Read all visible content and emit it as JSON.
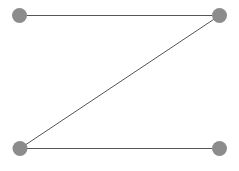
{
  "figure": {
    "width": 239,
    "height": 171,
    "background_color": "#ffffff"
  },
  "style": {
    "node_color": "#8c8c8c",
    "edge_color": "#555555",
    "node_radius": 7.5,
    "edge_width": 1
  },
  "chart_data": {
    "type": "diagram",
    "subtype": "node-link-graph",
    "title": "",
    "nodes": [
      {
        "id": "n1",
        "label": "",
        "x": 19.5,
        "y": 15.5,
        "position": "top-left",
        "degree": 1
      },
      {
        "id": "n2",
        "label": "",
        "x": 219.5,
        "y": 15.5,
        "position": "top-right",
        "degree": 2
      },
      {
        "id": "n3",
        "label": "",
        "x": 20.0,
        "y": 148.5,
        "position": "bottom-left",
        "degree": 2
      },
      {
        "id": "n4",
        "label": "",
        "x": 219.5,
        "y": 148.5,
        "position": "bottom-right",
        "degree": 1
      }
    ],
    "edges": [
      {
        "id": "e1",
        "source": "n1",
        "target": "n2",
        "label": "",
        "kind": "horizontal-top"
      },
      {
        "id": "e2",
        "source": "n2",
        "target": "n3",
        "label": "",
        "kind": "diagonal"
      },
      {
        "id": "e3",
        "source": "n3",
        "target": "n4",
        "label": "",
        "kind": "horizontal-bottom"
      }
    ],
    "legend": [],
    "annotations": []
  }
}
